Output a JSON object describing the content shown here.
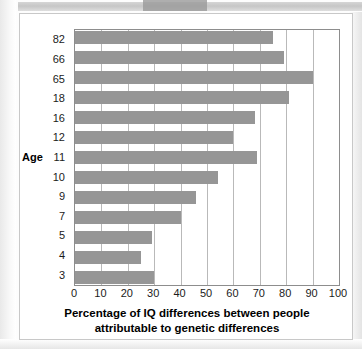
{
  "figure": {
    "axis_label_y": "Age",
    "xlabel_line1": "Percentage of IQ differences between people",
    "xlabel_line2": "attributable to genetic differences",
    "bar_color": "#969696",
    "grid_color": "#b9b9b9",
    "axis_color": "#8d8d8d"
  },
  "chart_data": {
    "type": "bar",
    "orientation": "horizontal",
    "title": "",
    "xlabel": "Percentage of IQ differences between people attributable to genetic differences",
    "ylabel": "Age",
    "categories": [
      "82",
      "66",
      "65",
      "18",
      "16",
      "12",
      "11",
      "10",
      "9",
      "7",
      "5",
      "4",
      "3"
    ],
    "values": [
      75,
      79,
      90,
      81,
      68,
      60,
      69,
      54,
      46,
      40,
      29,
      25,
      30
    ],
    "xlim": [
      0,
      100
    ],
    "xticks": [
      "0",
      "10",
      "20",
      "30",
      "40",
      "50",
      "60",
      "70",
      "80",
      "90",
      "100"
    ],
    "xtick_values": [
      0,
      10,
      20,
      30,
      40,
      50,
      60,
      70,
      80,
      90,
      100
    ],
    "grid": "vertical",
    "legend": "none"
  }
}
